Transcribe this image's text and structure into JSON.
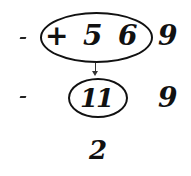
{
  "diagram": {
    "row1": {
      "left_mark": "-",
      "circled": {
        "operator": "+",
        "digits": [
          "5",
          "6"
        ]
      },
      "right_digit": "9"
    },
    "row2": {
      "left_mark": "-",
      "circled": "11",
      "right_digit": "9"
    },
    "row3": {
      "result": "2"
    },
    "arrow": "from (+ 5 6) down to (11)"
  }
}
